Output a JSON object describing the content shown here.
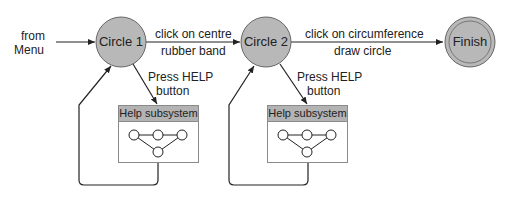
{
  "diagram": {
    "type": "state-transition",
    "colors": {
      "node_fill": "#b8b8b8",
      "node_stroke": "#666666",
      "line": "#222222",
      "help_header": "#b3b3b3"
    },
    "entry": {
      "label_line1": "from",
      "label_line2": "Menu"
    },
    "nodes": [
      {
        "id": "circle1",
        "label": "Circle 1"
      },
      {
        "id": "circle2",
        "label": "Circle 2"
      },
      {
        "id": "finish",
        "label": "Finish",
        "final": true
      }
    ],
    "transitions": [
      {
        "from": "circle1",
        "to": "circle2",
        "event": "click on centre",
        "action": "rubber band"
      },
      {
        "from": "circle2",
        "to": "finish",
        "event": "click on circumference",
        "action": "draw circle"
      },
      {
        "from": "circle1",
        "to": "help1",
        "event": "Press HELP",
        "action": "button"
      },
      {
        "from": "circle2",
        "to": "help2",
        "event": "Press HELP",
        "action": "button"
      }
    ],
    "help_boxes": [
      {
        "id": "help1",
        "title": "Help subsystem"
      },
      {
        "id": "help2",
        "title": "Help subsystem"
      }
    ]
  }
}
